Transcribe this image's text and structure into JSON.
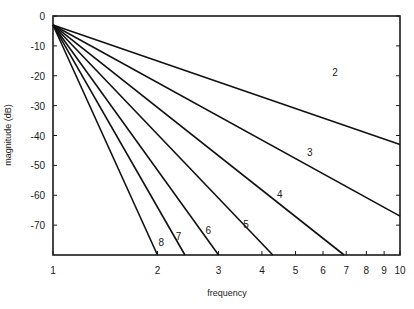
{
  "chart_data": {
    "type": "line",
    "title": "",
    "xlabel": "frequency",
    "ylabel": "magnitude (dB)",
    "xscale": "log",
    "xlim": [
      1,
      10
    ],
    "ylim": [
      -80,
      0
    ],
    "grid": false,
    "legend": "inline curve labels",
    "x_ticks": [
      1,
      2,
      3,
      4,
      5,
      6,
      7,
      8,
      9,
      10
    ],
    "x_tick_labels": [
      "1",
      "2",
      "3",
      "4",
      "5",
      "6",
      "7",
      "8",
      "9",
      "10"
    ],
    "y_ticks": [
      0,
      -10,
      -20,
      -30,
      -40,
      -50,
      -60,
      -70
    ],
    "y_tick_labels": [
      "0",
      "-10",
      "-20",
      "-30",
      "-40",
      "-50",
      "-60",
      "-70"
    ],
    "series": [
      {
        "name": "2",
        "points": [
          [
            1,
            -3
          ],
          [
            10,
            -43
          ]
        ],
        "label_at": [
          6.5,
          -20
        ]
      },
      {
        "name": "3",
        "points": [
          [
            1,
            -3
          ],
          [
            10,
            -67
          ]
        ],
        "label_at": [
          5.5,
          -47
        ]
      },
      {
        "name": "4",
        "points": [
          [
            1,
            -3
          ],
          [
            6.9,
            -80
          ]
        ],
        "label_at": [
          4.5,
          -61
        ]
      },
      {
        "name": "5",
        "points": [
          [
            1,
            -3
          ],
          [
            4.3,
            -80
          ]
        ],
        "label_at": [
          3.6,
          -71
        ]
      },
      {
        "name": "6",
        "points": [
          [
            1,
            -3
          ],
          [
            3.0,
            -80
          ]
        ],
        "label_at": [
          2.8,
          -73
        ]
      },
      {
        "name": "7",
        "points": [
          [
            1,
            -3
          ],
          [
            2.4,
            -80
          ]
        ],
        "label_at": [
          2.3,
          -75
        ]
      },
      {
        "name": "8",
        "points": [
          [
            1,
            -3
          ],
          [
            2.0,
            -80
          ]
        ],
        "label_at": [
          2.05,
          -77
        ]
      }
    ]
  }
}
